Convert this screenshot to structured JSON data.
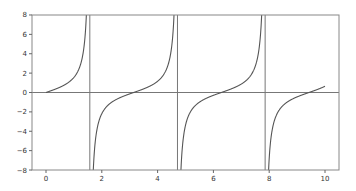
{
  "chart_data": {
    "type": "line",
    "title": "",
    "xlabel": "",
    "ylabel": "",
    "function": "tan(x)",
    "x_range": [
      0,
      10
    ],
    "xlim": [
      -0.5,
      10.5
    ],
    "ylim": [
      -8,
      8
    ],
    "grid": false,
    "legend": null,
    "xticks": [
      0,
      2,
      4,
      6,
      8,
      10
    ],
    "xtick_labels": [
      "0",
      "2",
      "4",
      "6",
      "8",
      "10"
    ],
    "yticks": [
      -8,
      -6,
      -4,
      -2,
      0,
      2,
      4,
      6,
      8
    ],
    "ytick_labels": [
      "−8",
      "−6",
      "−4",
      "−2",
      "0",
      "2",
      "4",
      "6",
      "8"
    ],
    "series": [
      {
        "name": "tan(x)",
        "color": "#555555",
        "sample_points": [
          [
            0,
            0
          ],
          [
            0.5,
            0.546
          ],
          [
            1.0,
            1.557
          ],
          [
            1.3,
            3.602
          ],
          [
            1.45,
            8.238
          ],
          [
            1.7,
            -7.697
          ],
          [
            2.0,
            -2.185
          ],
          [
            2.5,
            -0.747
          ],
          [
            3.0,
            -0.143
          ],
          [
            3.5,
            0.375
          ],
          [
            4.0,
            1.158
          ],
          [
            4.4,
            3.096
          ],
          [
            4.6,
            8.86
          ],
          [
            4.85,
            -6.4
          ],
          [
            5.0,
            -3.381
          ],
          [
            5.5,
            -0.996
          ],
          [
            6.0,
            -0.291
          ],
          [
            6.5,
            0.22
          ],
          [
            7.0,
            0.871
          ],
          [
            7.5,
            2.706
          ],
          [
            7.75,
            8.0
          ],
          [
            7.95,
            -8.0
          ],
          [
            8.2,
            -2.6
          ],
          [
            8.5,
            -1.5
          ],
          [
            9.0,
            -0.452
          ],
          [
            9.5,
            0.076
          ],
          [
            10.0,
            0.648
          ]
        ]
      }
    ],
    "reference_lines": {
      "horizontal": [
        0
      ],
      "vertical": [
        1.5708,
        4.7124,
        7.854
      ],
      "color": "#777777"
    }
  }
}
